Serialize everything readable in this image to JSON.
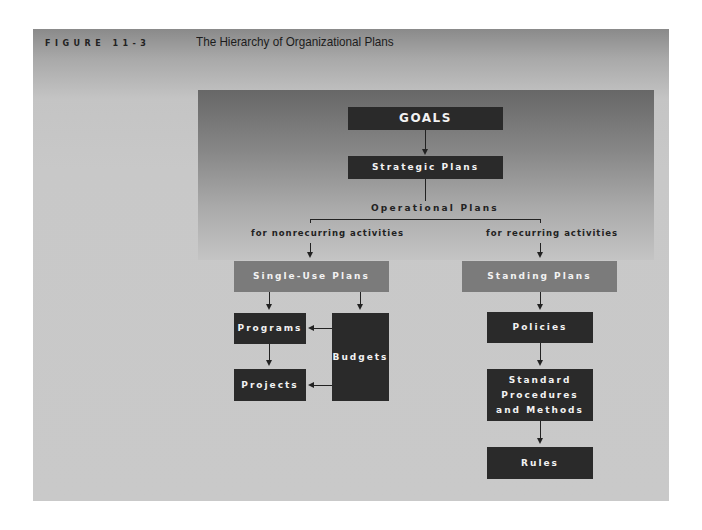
{
  "header": {
    "figure_label": "FIGURE 11-3",
    "title": "The Hierarchy of Organizational Plans"
  },
  "diagram": {
    "goals": "GOALS",
    "strategic": "Strategic Plans",
    "operational": "Operational Plans",
    "branches": {
      "left_label": "for nonrecurring activities",
      "right_label": "for recurring activities"
    },
    "single_use": {
      "title": "Single-Use Plans",
      "programs": "Programs",
      "projects": "Projects",
      "budgets": "Budgets"
    },
    "standing": {
      "title": "Standing Plans",
      "policies": "Policies",
      "procedures": "Standard Procedures and Methods",
      "procedures_lines": [
        "Standard",
        "Procedures",
        "and Methods"
      ],
      "rules": "Rules"
    }
  },
  "colors": {
    "dark_box": "#2a2a2a",
    "mid_box": "#7b7b7b",
    "background": "#c9c9c9",
    "panel_top": "#676767"
  }
}
